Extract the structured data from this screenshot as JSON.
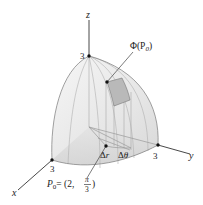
{
  "figure": {
    "axes": {
      "x_label": "x",
      "y_label": "y",
      "z_label": "z"
    },
    "intercepts": {
      "x": "3",
      "y": "3",
      "z": "3"
    },
    "labels": {
      "image_point": "Φ(P",
      "image_point_sub": "0",
      "image_point_close": ")",
      "delta_r": "Δr",
      "delta_theta": "Δθ",
      "p0_name": "P",
      "p0_sub": "0",
      "p0_eq": "= (2, ",
      "p0_num": "π",
      "p0_den": "3",
      "p0_close": ")"
    },
    "point_P0": {
      "r": 2,
      "theta": "π/3"
    },
    "colors": {
      "surface_fill": "#e9e9e9",
      "base_fill": "#dcdcdc",
      "patch_fill": "#b8b8b8",
      "line": "#555555",
      "light_line": "#a8a8a8"
    }
  }
}
